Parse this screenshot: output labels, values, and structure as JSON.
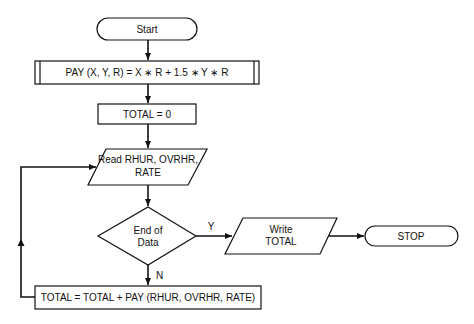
{
  "flowchart": {
    "nodes": {
      "start": {
        "type": "terminal",
        "label": "Start"
      },
      "define_pay": {
        "type": "predefined-process",
        "label": "PAY (X, Y, R) = X ∗ R + 1.5 ∗ Y ∗ R"
      },
      "init_total": {
        "type": "process",
        "label": "TOTAL = 0"
      },
      "read_input": {
        "type": "input",
        "line1": "Read RHUR, OVRHR,",
        "line2": "RATE"
      },
      "end_of_data": {
        "type": "decision",
        "line1": "End of",
        "line2": "Data"
      },
      "write_total": {
        "type": "output",
        "line1": "Write",
        "line2": "TOTAL"
      },
      "stop": {
        "type": "terminal",
        "label": "STOP"
      },
      "accumulate": {
        "type": "process",
        "label": "TOTAL = TOTAL + PAY (RHUR, OVRHR, RATE)"
      }
    },
    "edges": {
      "yes_label": "Y",
      "no_label": "N"
    }
  }
}
